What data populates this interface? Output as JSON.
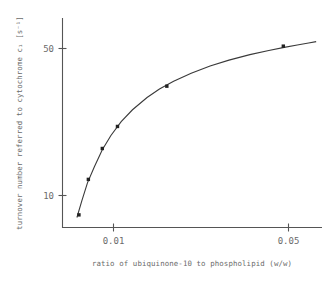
{
  "chart_data": {
    "type": "line",
    "title": "",
    "xlabel": "ratio of ubiquinone-10 to phospholipid (w/w)",
    "ylabel": "turnover number referred to cytochrome c1 [s-1]",
    "ylabel_display": "turnover number referred to cytochrome c₁ [s⁻¹]",
    "xscale": "log",
    "yscale": "log",
    "xlim": [
      0.0035,
      0.075
    ],
    "ylim": [
      5.5,
      68
    ],
    "xticks": [
      0.01,
      0.05
    ],
    "xticklabels": [
      "0.01",
      "0.05"
    ],
    "yticks": [
      10,
      50
    ],
    "yticklabels": [
      "10",
      "50"
    ],
    "grid": false,
    "legend": null,
    "series": [
      {
        "name": "turnover number vs ubiquinone-10 / phospholipid ratio",
        "marker": "square",
        "x": [
          0.00425,
          0.00475,
          0.0056,
          0.0067,
          0.012,
          0.0475
        ],
        "y": [
          6.4,
          9.8,
          14.2,
          18.5,
          30.0,
          48.5
        ]
      }
    ],
    "fit_curve": {
      "description": "smooth saturation (hyperbolic) curve through data points",
      "x": [
        0.00415,
        0.0044,
        0.0047,
        0.0051,
        0.0056,
        0.0062,
        0.007,
        0.008,
        0.0095,
        0.011,
        0.013,
        0.016,
        0.02,
        0.025,
        0.032,
        0.04,
        0.048,
        0.056,
        0.064,
        0.07
      ],
      "y": [
        6.2,
        7.6,
        9.4,
        11.4,
        14.0,
        16.6,
        19.6,
        22.6,
        26.2,
        29.0,
        31.8,
        35.0,
        38.2,
        41.0,
        43.8,
        46.0,
        47.8,
        49.2,
        50.4,
        51.2
      ]
    }
  },
  "axes": {
    "x_title": "ratio of ubiquinone-10 to phospholipid (w/w)",
    "y_title": "turnover number referred to cytochrome c₁ [s⁻¹]",
    "x_tick_0": "0.01",
    "x_tick_1": "0.05",
    "y_tick_0": "10",
    "y_tick_1": "50"
  },
  "colors": {
    "background": "#ffffff",
    "axis": "#555555",
    "curve": "#3a3a3a",
    "marker": "#222222",
    "text": "#6b6b6b"
  }
}
